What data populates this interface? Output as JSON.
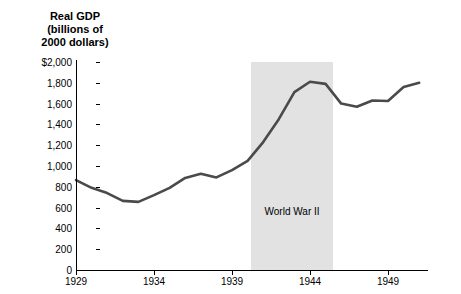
{
  "chart_data": {
    "type": "line",
    "title": "",
    "ylabel_lines": [
      "Real GDP",
      "(billions of",
      "2000 dollars)"
    ],
    "xlabel": "",
    "ylim": [
      0,
      2000
    ],
    "xlim": [
      1929,
      1951.5
    ],
    "yticks": [
      0,
      200,
      400,
      600,
      800,
      1000,
      1200,
      1400,
      1600,
      1800,
      2000
    ],
    "ytick_labels": [
      "0",
      "200",
      "400",
      "600",
      "800",
      "1,000",
      "1,200",
      "1,400",
      "1,600",
      "1,800",
      "$2,000"
    ],
    "xticks": [
      1929,
      1934,
      1939,
      1944,
      1949
    ],
    "xtick_labels": [
      "1929",
      "1934",
      "1939",
      "1944",
      "1949"
    ],
    "grid": false,
    "legend": "none",
    "line_color": "#4a4a4a",
    "band_color": "#e2e2e2",
    "annotations": [
      {
        "text": "World War II",
        "x_start": 1940.2,
        "x_end": 1945.5,
        "y_text": 620
      }
    ],
    "series": [
      {
        "name": "Real GDP",
        "x": [
          1929,
          1930,
          1931,
          1932,
          1933,
          1934,
          1935,
          1936,
          1937,
          1938,
          1939,
          1940,
          1941,
          1942,
          1943,
          1944,
          1945,
          1946,
          1947,
          1948,
          1949,
          1950,
          1951
        ],
        "values": [
          865,
          790,
          740,
          665,
          655,
          720,
          790,
          885,
          925,
          890,
          960,
          1050,
          1230,
          1450,
          1710,
          1810,
          1790,
          1600,
          1570,
          1630,
          1625,
          1760,
          1800
        ]
      }
    ]
  }
}
